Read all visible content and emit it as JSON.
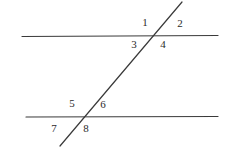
{
  "figure": {
    "width": 241,
    "height": 148,
    "background_color": "#ffffff",
    "line_color": "#3a3a3a",
    "label_color": "#2b2b2b",
    "stroke_width": 1.2
  },
  "lines": {
    "top_parallel": {
      "x1": 22,
      "y1": 36.5,
      "x2": 218,
      "y2": 35.5
    },
    "bottom_parallel": {
      "x1": 26,
      "y1": 117,
      "x2": 218,
      "y2": 116.5
    },
    "transversal": {
      "x1": 60,
      "y1": 146,
      "x2": 182,
      "y2": 2
    }
  },
  "intersections": {
    "top": {
      "x": 155,
      "y": 36
    },
    "bottom": {
      "x": 78,
      "y": 117
    }
  },
  "angle_labels": [
    {
      "text": "1",
      "x": 145,
      "y": 22
    },
    {
      "text": "2",
      "x": 180,
      "y": 23
    },
    {
      "text": "3",
      "x": 134,
      "y": 44
    },
    {
      "text": "4",
      "x": 163,
      "y": 44
    },
    {
      "text": "5",
      "x": 72,
      "y": 103
    },
    {
      "text": "6",
      "x": 103,
      "y": 104
    },
    {
      "text": "7",
      "x": 54,
      "y": 128
    },
    {
      "text": "8",
      "x": 86,
      "y": 128
    }
  ]
}
